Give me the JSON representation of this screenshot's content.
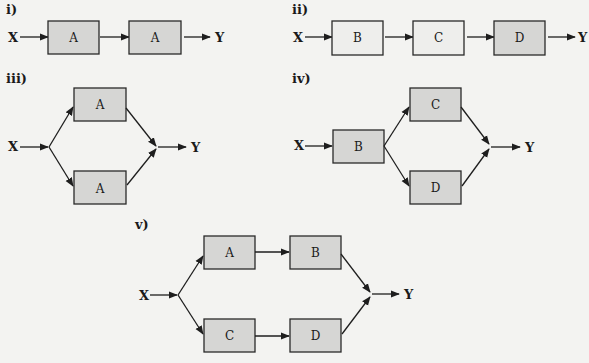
{
  "colors": {
    "background": "#f3f3f1",
    "shaded_box": "#d6d6d4",
    "plain_box": "#eeeeec",
    "stroke": "#2a2a2a"
  },
  "diagrams": [
    {
      "label": "i)",
      "topology": "series",
      "input": "X",
      "output": "Y",
      "blocks": [
        {
          "name": "A",
          "shaded": true
        },
        {
          "name": "A",
          "shaded": true
        }
      ]
    },
    {
      "label": "ii)",
      "topology": "series",
      "input": "X",
      "output": "Y",
      "blocks": [
        {
          "name": "B",
          "shaded": false
        },
        {
          "name": "C",
          "shaded": false
        },
        {
          "name": "D",
          "shaded": true
        }
      ]
    },
    {
      "label": "iii)",
      "topology": "parallel",
      "input": "X",
      "output": "Y",
      "blocks": [
        {
          "name": "A",
          "shaded": true
        },
        {
          "name": "A",
          "shaded": true
        }
      ]
    },
    {
      "label": "iv)",
      "topology": "series-parallel",
      "input": "X",
      "output": "Y",
      "blocks": [
        {
          "name": "B",
          "shaded": true
        },
        {
          "name": "C",
          "shaded": true
        },
        {
          "name": "D",
          "shaded": true
        }
      ]
    },
    {
      "label": "v)",
      "topology": "parallel-of-series",
      "input": "X",
      "output": "Y",
      "blocks": [
        {
          "name": "A",
          "shaded": true
        },
        {
          "name": "B",
          "shaded": true
        },
        {
          "name": "C",
          "shaded": true
        },
        {
          "name": "D",
          "shaded": true
        }
      ]
    }
  ]
}
